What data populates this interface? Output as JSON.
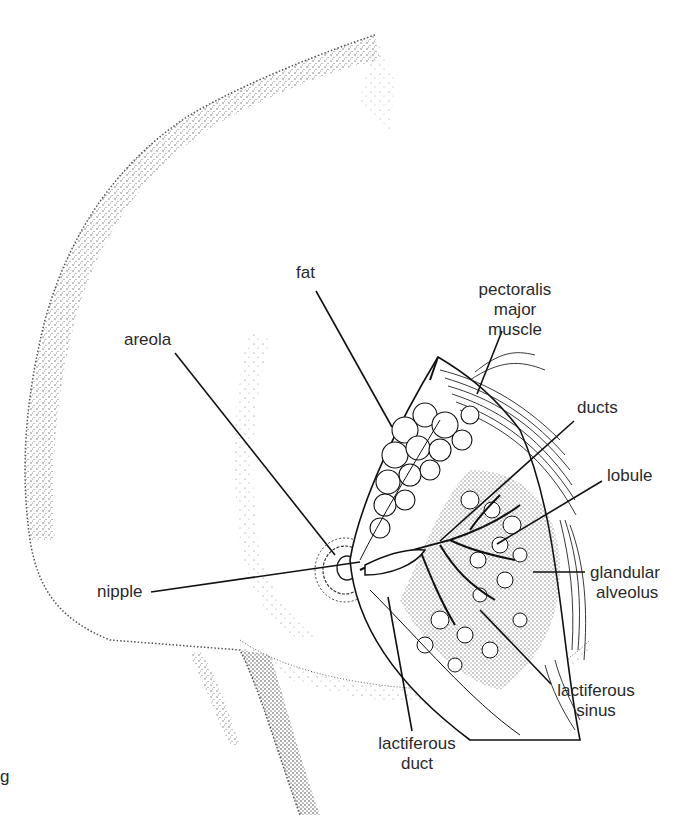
{
  "figure": {
    "stray_glyph": "g"
  },
  "labels": {
    "fat": "fat",
    "pectoralis": [
      "pectoralis",
      "major",
      "muscle"
    ],
    "areola": "areola",
    "ducts": "ducts",
    "lobule": "lobule",
    "glandular_alveolus": [
      "glandular",
      "alveolus"
    ],
    "nipple": "nipple",
    "lactiferous_sinus": [
      "lactiferous",
      "sinus"
    ],
    "lactiferous_duct": [
      "lactiferous",
      "duct"
    ]
  },
  "colors": {
    "ink": "#1a1a1a",
    "stipple": "#555555",
    "background": "#ffffff"
  }
}
